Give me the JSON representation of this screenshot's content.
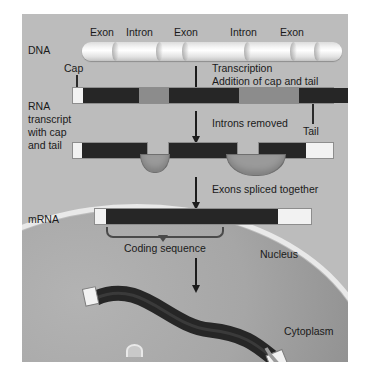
{
  "figure": {
    "background": "#ffffff",
    "panel_color": "#bcbcbc",
    "exon_color": "#262626",
    "intron_color": "#8c8c8c",
    "cap_color": "#f2f2f2",
    "envelope_color": "#e9e9e9"
  },
  "row_labels": {
    "dna": "DNA",
    "rna_transcript": "RNA\ntranscript\nwith cap\nand tail",
    "rna_transcript_lines": [
      "RNA",
      "transcript",
      "with cap",
      "and tail"
    ],
    "mrna": "mRNA"
  },
  "dna_segments": [
    {
      "type": "end",
      "label": ""
    },
    {
      "type": "exon",
      "label": "Exon"
    },
    {
      "type": "intron",
      "label": "Intron"
    },
    {
      "type": "exon",
      "label": "Exon"
    },
    {
      "type": "intron",
      "label": "Intron"
    },
    {
      "type": "exon",
      "label": "Exon"
    },
    {
      "type": "end",
      "label": ""
    }
  ],
  "dna_top_labels": [
    "Exon",
    "Intron",
    "Exon",
    "Intron",
    "Exon"
  ],
  "steps": [
    {
      "id": "transcription",
      "lines": [
        "Transcription",
        "Addition of cap and tail"
      ]
    },
    {
      "id": "introns-removed",
      "lines": [
        "Introns removed"
      ]
    },
    {
      "id": "exons-spliced",
      "lines": [
        "Exons spliced together"
      ]
    }
  ],
  "callouts": {
    "cap": "Cap",
    "tail": "Tail",
    "coding_sequence": "Coding sequence"
  },
  "compartments": {
    "nucleus": "Nucleus",
    "cytoplasm": "Cytoplasm"
  },
  "transcript_segments": [
    {
      "type": "cap",
      "label": "Cap"
    },
    {
      "type": "exon",
      "label": "Exon"
    },
    {
      "type": "intron",
      "label": "Intron"
    },
    {
      "type": "exon",
      "label": "Exon"
    },
    {
      "type": "intron",
      "label": "Intron"
    },
    {
      "type": "exon",
      "label": "Exon"
    },
    {
      "type": "tail",
      "label": "Tail"
    }
  ],
  "mrna_segments": [
    {
      "type": "cap",
      "label": "Cap"
    },
    {
      "type": "exon",
      "label": "Coding sequence"
    },
    {
      "type": "tail",
      "label": "Tail"
    }
  ]
}
